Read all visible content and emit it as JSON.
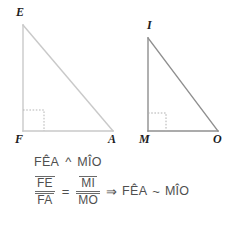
{
  "figure": {
    "triangles": [
      {
        "name": "triangle-EFA",
        "vertices": [
          {
            "id": "E",
            "label": "E",
            "x": 23,
            "y": 25
          },
          {
            "id": "F",
            "label": "F",
            "x": 23,
            "y": 131
          },
          {
            "id": "A",
            "label": "A",
            "x": 113,
            "y": 131
          }
        ],
        "stroke": "#c9c9c9",
        "right_angle_at": "F",
        "right_angle_marker": "dotted-square"
      },
      {
        "name": "triangle-IMO",
        "vertices": [
          {
            "id": "I",
            "label": "I",
            "x": 148,
            "y": 38
          },
          {
            "id": "M",
            "label": "M",
            "x": 148,
            "y": 131
          },
          {
            "id": "O",
            "label": "O",
            "x": 218,
            "y": 131
          }
        ],
        "stroke": "#8f8f8f",
        "right_angle_at": "M",
        "right_angle_marker": "dotted-square"
      }
    ]
  },
  "math": {
    "line1": {
      "left": "FÊA",
      "operator": "^",
      "right": "MÎO"
    },
    "line2": {
      "fraction1": {
        "numerator": "FE",
        "denominator": "FA"
      },
      "equals": "=",
      "fraction2": {
        "numerator": "MI",
        "denominator": "MO"
      },
      "implies": "⇒",
      "left": "FÊA",
      "similar": "~",
      "right": "MÎO"
    }
  },
  "colors": {
    "background": "#ffffff",
    "triangle_left_stroke": "#c9c9c9",
    "triangle_right_stroke": "#8f8f8f",
    "label_text": "#1c1c1c",
    "math_text": "#4f4f4f",
    "right_angle_marker": "#b0b0b0"
  }
}
